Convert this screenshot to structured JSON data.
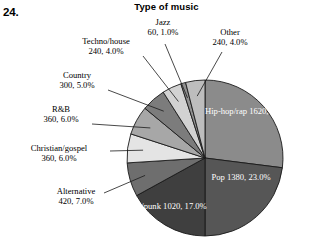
{
  "question_number": "24.",
  "chart_data": {
    "type": "pie",
    "title": "Type of music",
    "xlabel": "",
    "ylabel": "",
    "legend_position": "none",
    "grid": false,
    "total": 6000,
    "categories": [
      "Hip-hop/rap",
      "Pop",
      "Rock/punk",
      "Alternative",
      "Christian/gospel",
      "R&B",
      "Country",
      "Techno/house",
      "Jazz",
      "Other"
    ],
    "values": [
      1620,
      1380,
      1020,
      420,
      360,
      360,
      300,
      240,
      60,
      240
    ],
    "percents": [
      27.0,
      23.0,
      17.0,
      7.0,
      6.0,
      6.0,
      5.0,
      4.0,
      1.0,
      4.0
    ],
    "slices": [
      {
        "label": "Hip-hop/rap",
        "value": 1620,
        "percent": 27.0,
        "value_text": "1620, 27.0%",
        "color": "#8b8b8b",
        "label_placement": "inside"
      },
      {
        "label": "Pop",
        "value": 1380,
        "percent": 23.0,
        "value_text": "1380, 23.0%",
        "color": "#565656",
        "label_placement": "inside"
      },
      {
        "label": "Rock/punk",
        "value": 1020,
        "percent": 17.0,
        "value_text": "1020, 17.0%",
        "color": "#3f3f3f",
        "label_placement": "inside"
      },
      {
        "label": "Alternative",
        "value": 420,
        "percent": 7.0,
        "value_text": "420, 7.0%",
        "color": "#6e6e6e",
        "label_placement": "callout"
      },
      {
        "label": "Christian/gospel",
        "value": 360,
        "percent": 6.0,
        "value_text": "360, 6.0%",
        "color": "#e4e4e4",
        "label_placement": "callout"
      },
      {
        "label": "R&B",
        "value": 360,
        "percent": 6.0,
        "value_text": "360, 6.0%",
        "color": "#a7a7a7",
        "label_placement": "callout"
      },
      {
        "label": "Country",
        "value": 300,
        "percent": 5.0,
        "value_text": "300, 5.0%",
        "color": "#7c7c7c",
        "label_placement": "callout"
      },
      {
        "label": "Techno/house",
        "value": 240,
        "percent": 4.0,
        "value_text": "240, 4.0%",
        "color": "#d2d2d2",
        "label_placement": "callout"
      },
      {
        "label": "Jazz",
        "value": 60,
        "percent": 1.0,
        "value_text": "60, 1.0%",
        "color": "#909090",
        "label_placement": "callout"
      },
      {
        "label": "Other",
        "value": 240,
        "percent": 4.0,
        "value_text": "240, 4.0%",
        "color": "#bdbdbd",
        "label_placement": "callout"
      }
    ]
  },
  "colors": {
    "background": "#ffffff",
    "text": "#000000",
    "inside_label_text": "#ffffff",
    "slice_outline": "#1a1a1a",
    "leader_line": "#1a1a1a"
  }
}
